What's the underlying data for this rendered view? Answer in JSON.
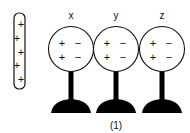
{
  "figure": {
    "caption": "(1)",
    "rod": {
      "charges": [
        "+",
        "+",
        "+",
        "+",
        "+"
      ]
    },
    "spheres": [
      {
        "label": "x",
        "charges": {
          "left": [
            "+",
            "+"
          ],
          "right": [
            "−",
            "−"
          ]
        }
      },
      {
        "label": "y",
        "charges": {
          "left": [
            "+",
            "+"
          ],
          "right": [
            "−",
            "−"
          ]
        }
      },
      {
        "label": "z",
        "charges": {
          "left": [
            "+",
            "+"
          ],
          "right": [
            "−",
            "−"
          ]
        }
      }
    ]
  }
}
